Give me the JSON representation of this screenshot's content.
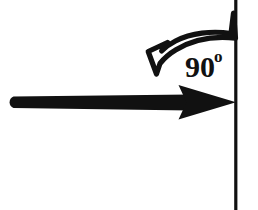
{
  "diagram": {
    "background_color": "#ffffff",
    "ink_color": "#111111",
    "angle_label": {
      "value": "90",
      "unit_symbol": "o",
      "full_text": "90o"
    },
    "elements": {
      "surface_line": {
        "name": "vertical surface line",
        "orientation": "vertical",
        "color": "#111111"
      },
      "incident_arrow": {
        "name": "horizontal incident arrow",
        "direction": "right",
        "style": "solid filled",
        "color": "#111111"
      },
      "angle_arc_arrow": {
        "name": "curved angle arrow",
        "direction": "counterclockwise down-left",
        "style": "outlined hollow",
        "stroke_color": "#111111",
        "fill_color": "#ffffff"
      }
    }
  }
}
